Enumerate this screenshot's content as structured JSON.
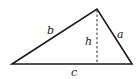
{
  "diagram": {
    "vertices": {
      "left": [
        12,
        64
      ],
      "apex": [
        97,
        9
      ],
      "right": [
        132,
        64
      ],
      "foot": [
        97,
        64
      ]
    },
    "labels": {
      "side_b": "b",
      "side_a": "a",
      "side_c": "c",
      "height": "h"
    },
    "colors": {
      "stroke": "#1a1a1a",
      "background": "#ffffff"
    }
  }
}
